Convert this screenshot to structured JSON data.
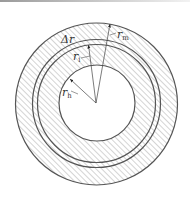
{
  "diagram": {
    "type": "annular cross-section",
    "center": [
      96,
      103
    ],
    "circles": {
      "outer_r": 81,
      "ring_a_r": 64,
      "ring_b_r": 59,
      "hole_r": 38
    },
    "labels": {
      "delta_r": {
        "main": "Δr",
        "sub": ""
      },
      "r_m": {
        "main": "r",
        "sub": "m"
      },
      "r_i": {
        "main": "r",
        "sub": "i"
      },
      "r_h": {
        "main": "r",
        "sub": "h"
      }
    },
    "colors": {
      "stroke": "#555555",
      "hatch": "#9a9a9a",
      "background": "#ffffff"
    }
  }
}
